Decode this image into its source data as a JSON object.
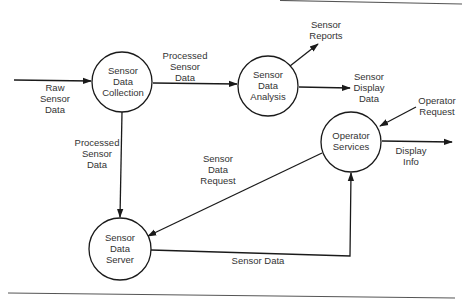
{
  "diagram": {
    "type": "data-flow-diagram",
    "nodes": [
      {
        "id": "collection",
        "lines": [
          "Sensor",
          "Data",
          "Collection"
        ],
        "cx": 122,
        "cy": 82,
        "r": 30
      },
      {
        "id": "analysis",
        "lines": [
          "Sensor",
          "Data",
          "Analysis"
        ],
        "cx": 268,
        "cy": 86,
        "r": 30
      },
      {
        "id": "operator",
        "lines": [
          "Operator",
          "Services"
        ],
        "cx": 351,
        "cy": 142,
        "r": 30
      },
      {
        "id": "server",
        "lines": [
          "Sensor",
          "Data",
          "Server"
        ],
        "cx": 120,
        "cy": 249,
        "r": 31
      }
    ],
    "edges": [
      {
        "id": "raw",
        "from": "external",
        "to": "collection",
        "label": [
          "Raw",
          "Sensor",
          "Data"
        ]
      },
      {
        "id": "processed-h",
        "from": "collection",
        "to": "analysis",
        "label": [
          "Processed",
          "Sensor",
          "Data"
        ]
      },
      {
        "id": "reports",
        "from": "analysis",
        "to": "external",
        "label": [
          "Sensor",
          "Reports"
        ]
      },
      {
        "id": "display-data",
        "from": "analysis",
        "to": "external",
        "label": [
          "Sensor",
          "Display",
          "Data"
        ]
      },
      {
        "id": "op-request",
        "from": "external",
        "to": "operator",
        "label": [
          "Operator",
          "Request"
        ]
      },
      {
        "id": "display-info",
        "from": "operator",
        "to": "external",
        "label": [
          "Display",
          "Info"
        ]
      },
      {
        "id": "processed-v",
        "from": "collection",
        "to": "server",
        "label": [
          "Processed",
          "Sensor",
          "Data"
        ]
      },
      {
        "id": "data-request",
        "from": "operator",
        "to": "server",
        "label": [
          "Sensor",
          "Data",
          "Request"
        ]
      },
      {
        "id": "sensor-data",
        "from": "server",
        "to": "operator",
        "label": [
          "Sensor Data"
        ]
      }
    ]
  },
  "labels": {
    "collection": {
      "l1": "Sensor",
      "l2": "Data",
      "l3": "Collection"
    },
    "analysis": {
      "l1": "Sensor",
      "l2": "Data",
      "l3": "Analysis"
    },
    "operator": {
      "l1": "Operator",
      "l2": "Services"
    },
    "server": {
      "l1": "Sensor",
      "l2": "Data",
      "l3": "Server"
    },
    "raw": {
      "l1": "Raw",
      "l2": "Sensor",
      "l3": "Data"
    },
    "processed_h": {
      "l1": "Processed",
      "l2": "Sensor",
      "l3": "Data"
    },
    "reports": {
      "l1": "Sensor",
      "l2": "Reports"
    },
    "display_data": {
      "l1": "Sensor",
      "l2": "Display",
      "l3": "Data"
    },
    "op_request": {
      "l1": "Operator",
      "l2": "Request"
    },
    "display_info": {
      "l1": "Display",
      "l2": "Info"
    },
    "processed_v": {
      "l1": "Processed",
      "l2": "Sensor",
      "l3": "Data"
    },
    "data_request": {
      "l1": "Sensor",
      "l2": "Data",
      "l3": "Request"
    },
    "sensor_data": {
      "l1": "Sensor Data"
    }
  }
}
